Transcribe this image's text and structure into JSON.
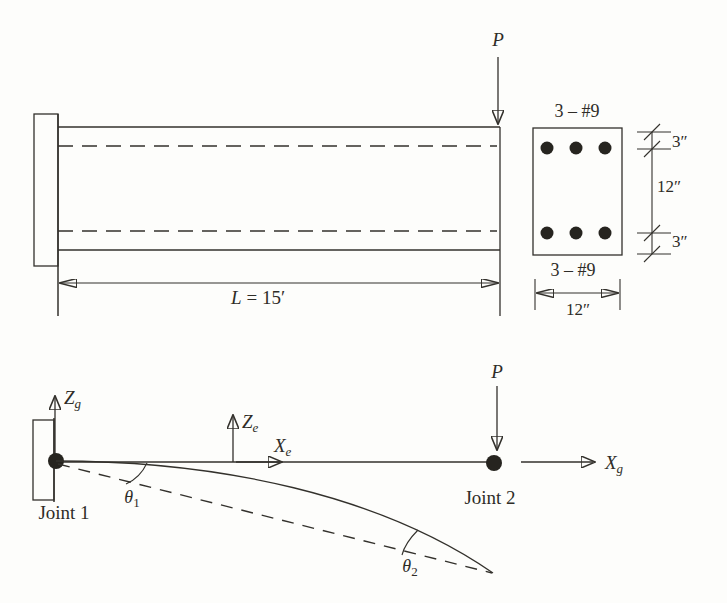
{
  "figure1": {
    "load_label": "P",
    "length_dim": {
      "variable": "L",
      "equals_value": "= 15′"
    },
    "section": {
      "top_bars_label": "3 – #9",
      "bottom_bars_label": "3 – #9",
      "top_cover": "3″",
      "core_depth": "12″",
      "bottom_cover": "3″",
      "width": "12″"
    }
  },
  "figure2": {
    "load_label": "P",
    "axes": {
      "global_z": {
        "base": "Z",
        "sub": "g"
      },
      "global_x": {
        "base": "X",
        "sub": "g"
      },
      "element_z": {
        "base": "Z",
        "sub": "e"
      },
      "element_x": {
        "base": "X",
        "sub": "e"
      }
    },
    "joint1_label": "Joint 1",
    "joint2_label": "Joint 2",
    "theta1": {
      "base": "θ",
      "sub": "1"
    },
    "theta2": {
      "base": "θ",
      "sub": "2"
    }
  },
  "colors": {
    "ink": "#33312c",
    "paper": "#fdfdfb"
  }
}
